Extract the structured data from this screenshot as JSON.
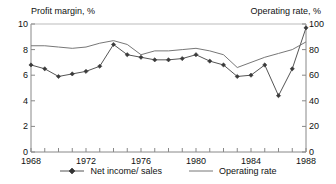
{
  "chart_data": {
    "type": "line",
    "title": "",
    "xlabel": "",
    "ylabel": "Profit  margin, %",
    "y2label": "Operating rate, %",
    "grid": false,
    "legend_position": "bottom-center",
    "x": [
      1968,
      1969,
      1970,
      1971,
      1972,
      1973,
      1974,
      1975,
      1976,
      1977,
      1978,
      1979,
      1980,
      1981,
      1982,
      1983,
      1984,
      1985,
      1986,
      1987,
      1988
    ],
    "xlim": [
      1968,
      1988
    ],
    "xticks": [
      1968,
      1969,
      1970,
      1971,
      1972,
      1973,
      1974,
      1975,
      1976,
      1977,
      1978,
      1979,
      1980,
      1981,
      1982,
      1983,
      1984,
      1985,
      1986,
      1987,
      1988
    ],
    "xtick_labels_shown": [
      "1968",
      "1972",
      "1976",
      "1980",
      "1984",
      "1988"
    ],
    "ylim": [
      0,
      10
    ],
    "yticks": [
      0,
      2,
      4,
      6,
      8,
      10
    ],
    "ytick_labels": [
      "0",
      "2",
      "4",
      "6",
      "8",
      "10"
    ],
    "y2lim": [
      0,
      100
    ],
    "y2ticks": [
      0,
      20,
      40,
      60,
      80,
      100
    ],
    "y2tick_labels": [
      "0",
      "20",
      "40",
      "60",
      "80",
      "100"
    ],
    "series": [
      {
        "name": "Net income/ sales",
        "axis": "left",
        "marker": "diamond",
        "color": "#555555",
        "values": [
          6.8,
          6.5,
          5.9,
          6.1,
          6.3,
          6.7,
          8.4,
          7.6,
          7.4,
          7.2,
          7.2,
          7.3,
          7.6,
          7.1,
          6.8,
          5.9,
          6.0,
          6.8,
          4.4,
          6.5,
          9.7
        ]
      },
      {
        "name": "Operating rate",
        "axis": "right",
        "marker": "none",
        "color": "#777777",
        "values": [
          83,
          83,
          82,
          81,
          82,
          85,
          87,
          84,
          76,
          79,
          79,
          80,
          81,
          79,
          76,
          66,
          70,
          74,
          77,
          80,
          86
        ]
      }
    ]
  },
  "legend": {
    "items": [
      {
        "label": "Net income/ sales",
        "style": "line-with-marker"
      },
      {
        "label": "Operating rate",
        "style": "line"
      }
    ]
  }
}
